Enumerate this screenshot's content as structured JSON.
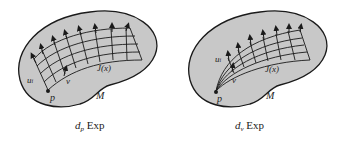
{
  "figures": [
    {
      "id": "left",
      "labels": {
        "u": "u",
        "u_sub": "i",
        "v": "v",
        "p": "p",
        "jacobi": "J(x)",
        "manifold": "M"
      },
      "caption": {
        "d": "d",
        "sub": "p",
        "op": "Exp"
      }
    },
    {
      "id": "right",
      "labels": {
        "u": "u",
        "u_sub": "i",
        "v": "v",
        "p": "p",
        "jacobi": "J(x)",
        "manifold": "M"
      },
      "caption": {
        "d": "d",
        "sub": "v",
        "op": "Exp"
      }
    }
  ],
  "colors": {
    "manifold_fill": "#c8c8c8",
    "outline": "#1a1a1a",
    "background": "#ffffff"
  }
}
